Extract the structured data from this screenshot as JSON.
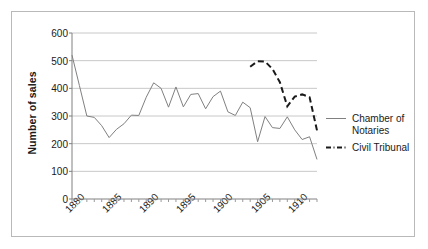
{
  "chart_data": {
    "type": "line",
    "title": "",
    "xlabel": "",
    "ylabel": "Number of sales",
    "xlim": [
      1880,
      1913
    ],
    "ylim": [
      0,
      600
    ],
    "ytick_values": [
      0,
      100,
      200,
      300,
      400,
      500,
      600
    ],
    "ytick_labels": [
      "0",
      "100",
      "200",
      "300",
      "400",
      "500",
      "600"
    ],
    "xtick_values": [
      1880,
      1885,
      1890,
      1895,
      1900,
      1905,
      1910
    ],
    "xtick_labels": [
      "1880",
      "1885",
      "1890",
      "1895",
      "1900",
      "1905",
      "1910"
    ],
    "grid": "horizontal",
    "legend_position": "right",
    "series": [
      {
        "name": "Chamber of Notaries",
        "style": "solid",
        "color": "#808080",
        "x": [
          1880,
          1881,
          1882,
          1883,
          1884,
          1885,
          1886,
          1887,
          1888,
          1889,
          1890,
          1891,
          1892,
          1893,
          1894,
          1895,
          1896,
          1897,
          1898,
          1899,
          1900,
          1901,
          1902,
          1903,
          1904,
          1905,
          1906,
          1907,
          1908,
          1909,
          1910,
          1911,
          1912,
          1913
        ],
        "values": [
          520,
          410,
          300,
          295,
          265,
          222,
          252,
          272,
          303,
          302,
          368,
          420,
          400,
          332,
          405,
          333,
          378,
          381,
          326,
          370,
          390,
          315,
          302,
          350,
          330,
          207,
          298,
          258,
          255,
          297,
          250,
          215,
          225,
          143
        ]
      },
      {
        "name": "Civil Tribunal",
        "style": "dashed",
        "color": "#1a1a1a",
        "x": [
          1904,
          1905,
          1906,
          1907,
          1908,
          1909,
          1910,
          1911,
          1912,
          1913
        ],
        "values": [
          478,
          498,
          497,
          470,
          422,
          335,
          370,
          378,
          368,
          248
        ]
      }
    ]
  },
  "legend": {
    "entries": [
      {
        "label_line1": "Chamber of",
        "label_line2": "Notaries"
      },
      {
        "label_line1": "Civil Tribunal",
        "label_line2": ""
      }
    ]
  }
}
